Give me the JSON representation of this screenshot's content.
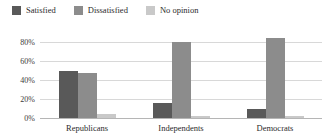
{
  "chart_data": {
    "type": "bar",
    "title": "",
    "subtitle": "",
    "xlabel": "",
    "ylabel": "",
    "categories": [
      "Republicans",
      "Independents",
      "Democrats"
    ],
    "series": [
      {
        "name": "Satisfied",
        "color": "#595959",
        "values": [
          50,
          16,
          9
        ]
      },
      {
        "name": "Dissatisfied",
        "color": "#8c8c8c",
        "values": [
          47,
          80,
          84
        ]
      },
      {
        "name": "No opinion",
        "color": "#c9c9c9",
        "values": [
          4,
          2,
          2
        ]
      }
    ],
    "ylim": [
      0,
      80
    ],
    "yticks": [
      0,
      20,
      40,
      60,
      80
    ],
    "ytick_labels": [
      "0%",
      "20%",
      "40%",
      "60%",
      "80%"
    ],
    "grid": true,
    "legend_position": "top-left",
    "value_unit": "%"
  }
}
